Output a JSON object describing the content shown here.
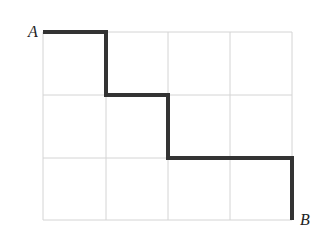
{
  "diagram": {
    "type": "grid-path",
    "grid": {
      "columns": 4,
      "rows": 3,
      "grid_color": "#d4d4d4"
    },
    "path": {
      "color": "#333333",
      "points": [
        [
          0,
          0
        ],
        [
          1,
          0
        ],
        [
          1,
          1
        ],
        [
          2,
          1
        ],
        [
          2,
          2
        ],
        [
          4,
          2
        ],
        [
          4,
          3
        ]
      ]
    },
    "labels": {
      "start": "A",
      "end": "B"
    }
  }
}
